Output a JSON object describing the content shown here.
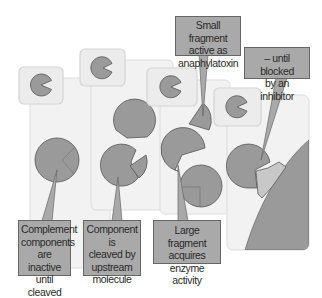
{
  "colors": {
    "page_bg": "#ffffff",
    "panel_bg": "#f1f1f1",
    "panel_border": "#dadada",
    "small_panel_bg": "#ececec",
    "shape_fill": "#9a9a9a",
    "shape_stroke": "#555555",
    "inhibitor_fill": "#c8c8c8",
    "label_bg": "#a9a9a9",
    "label_border": "#666666",
    "text": "#2a2a2a"
  },
  "labels": {
    "step1": {
      "lines": [
        "Complement",
        "components",
        "are inactive",
        "until cleaved"
      ]
    },
    "step2": {
      "lines": [
        "Component is",
        "cleaved by",
        "upstream",
        "molecule"
      ]
    },
    "step3": {
      "lines": [
        "Large fragment",
        "acquires enzyme",
        "activity"
      ]
    },
    "small_fragment": {
      "lines": [
        "Small fragment",
        "active as",
        "anaphylatoxin"
      ]
    },
    "inhibitor": {
      "lines": [
        "– until blocked",
        "by an inhibitor"
      ]
    }
  }
}
